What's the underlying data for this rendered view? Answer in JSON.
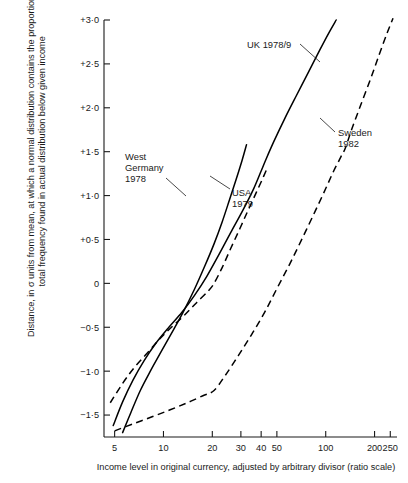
{
  "chart_data": {
    "type": "line",
    "title": "",
    "xlabel": "Income level in original currency, adjusted by arbitrary divisor (ratio scale)",
    "ylabel_line1": "Distance, in σ units from mean, at which a normal distribution contains the proportion of",
    "ylabel_line2": "total frequency found in actual distribution below given income",
    "xscale": "log",
    "xlim": [
      4.3,
      275
    ],
    "ylim": [
      -1.75,
      3.0
    ],
    "grid": false,
    "legend_position": "inline-annotations",
    "x_ticks": [
      {
        "value": 5,
        "label": "5"
      },
      {
        "value": 10,
        "label": "10"
      },
      {
        "value": 20,
        "label": "20"
      },
      {
        "value": 30,
        "label": "30"
      },
      {
        "value": 40,
        "label": "40"
      },
      {
        "value": 50,
        "label": "50"
      },
      {
        "value": 100,
        "label": "100"
      },
      {
        "value": 200,
        "label": "200"
      },
      {
        "value": 250,
        "label": "250"
      }
    ],
    "y_ticks": [
      {
        "value": 3.0,
        "label": "+3·0"
      },
      {
        "value": 2.5,
        "label": "+2·5"
      },
      {
        "value": 2.0,
        "label": "+2·0"
      },
      {
        "value": 1.5,
        "label": "+1·5"
      },
      {
        "value": 1.0,
        "label": "+1·0"
      },
      {
        "value": 0.5,
        "label": "+0·5"
      },
      {
        "value": 0.0,
        "label": "0"
      },
      {
        "value": -0.5,
        "label": "−0·5"
      },
      {
        "value": -1.0,
        "label": "−1·0"
      },
      {
        "value": -1.5,
        "label": "−1·5"
      }
    ],
    "series": [
      {
        "name": "West Germany 1978",
        "label_line1": "West",
        "label_line2": "Germany",
        "label_line3": "1978",
        "style": "solid",
        "color": "#000000",
        "points": [
          [
            5.6,
            -1.7
          ],
          [
            6.3,
            -1.47
          ],
          [
            7.2,
            -1.22
          ],
          [
            8.3,
            -1.0
          ],
          [
            9.6,
            -0.79
          ],
          [
            11.2,
            -0.57
          ],
          [
            13.2,
            -0.33
          ],
          [
            15.5,
            -0.07
          ],
          [
            18.0,
            0.2
          ],
          [
            20.5,
            0.45
          ],
          [
            23.0,
            0.7
          ],
          [
            25.5,
            0.95
          ],
          [
            28.0,
            1.18
          ],
          [
            30.5,
            1.4
          ],
          [
            32.5,
            1.58
          ]
        ]
      },
      {
        "name": "UK 1978/9",
        "label_line1": "UK 1978/9",
        "style": "solid",
        "color": "#000000",
        "points": [
          [
            4.9,
            -1.62
          ],
          [
            5.6,
            -1.35
          ],
          [
            6.5,
            -1.1
          ],
          [
            7.6,
            -0.88
          ],
          [
            9.0,
            -0.68
          ],
          [
            10.8,
            -0.5
          ],
          [
            13.0,
            -0.33
          ],
          [
            15.5,
            -0.14
          ],
          [
            18.5,
            0.08
          ],
          [
            22.0,
            0.33
          ],
          [
            26.0,
            0.58
          ],
          [
            31.0,
            0.84
          ],
          [
            36.0,
            1.08
          ],
          [
            40.0,
            1.28
          ],
          [
            43.0,
            1.42
          ],
          [
            48.0,
            1.62
          ],
          [
            56.0,
            1.88
          ],
          [
            66.0,
            2.14
          ],
          [
            78.0,
            2.4
          ],
          [
            92.0,
            2.66
          ],
          [
            105.0,
            2.86
          ],
          [
            116.0,
            3.0
          ]
        ]
      },
      {
        "name": "USA 1979",
        "label_line1": "USA",
        "label_line2": "1979",
        "style": "dashed",
        "color": "#000000",
        "points": [
          [
            4.7,
            -1.36
          ],
          [
            5.6,
            -1.14
          ],
          [
            6.6,
            -0.96
          ],
          [
            7.9,
            -0.8
          ],
          [
            9.4,
            -0.64
          ],
          [
            11.2,
            -0.5
          ],
          [
            13.5,
            -0.36
          ],
          [
            16.0,
            -0.22
          ],
          [
            19.0,
            -0.08
          ],
          [
            20.5,
            0.0
          ],
          [
            23.0,
            0.18
          ],
          [
            26.0,
            0.4
          ],
          [
            29.5,
            0.62
          ],
          [
            33.0,
            0.82
          ],
          [
            37.0,
            1.02
          ],
          [
            41.0,
            1.2
          ],
          [
            44.0,
            1.33
          ]
        ]
      },
      {
        "name": "Sweden 1982",
        "label_line1": "Sweden",
        "label_line2": "1982",
        "style": "dashed",
        "color": "#000000",
        "points": [
          [
            5.0,
            -1.68
          ],
          [
            6.5,
            -1.6
          ],
          [
            8.5,
            -1.52
          ],
          [
            11.0,
            -1.44
          ],
          [
            14.0,
            -1.36
          ],
          [
            17.5,
            -1.28
          ],
          [
            20.5,
            -1.22
          ],
          [
            24.0,
            -1.05
          ],
          [
            29.0,
            -0.82
          ],
          [
            35.0,
            -0.58
          ],
          [
            42.0,
            -0.33
          ],
          [
            50.0,
            -0.06
          ],
          [
            60.0,
            0.22
          ],
          [
            72.0,
            0.52
          ],
          [
            86.0,
            0.82
          ],
          [
            100.0,
            1.08
          ],
          [
            112.0,
            1.28
          ],
          [
            124.0,
            1.44
          ],
          [
            132.0,
            1.54
          ],
          [
            145.0,
            1.76
          ],
          [
            165.0,
            2.04
          ],
          [
            190.0,
            2.34
          ],
          [
            215.0,
            2.62
          ],
          [
            240.0,
            2.86
          ],
          [
            260.0,
            3.02
          ]
        ]
      }
    ],
    "annotations": [
      {
        "text": "West Germany 1978",
        "leader": true
      },
      {
        "text": "UK 1978/9",
        "leader": true
      },
      {
        "text": "USA 1979",
        "leader": true
      },
      {
        "text": "Sweden 1982",
        "leader": true
      }
    ]
  }
}
